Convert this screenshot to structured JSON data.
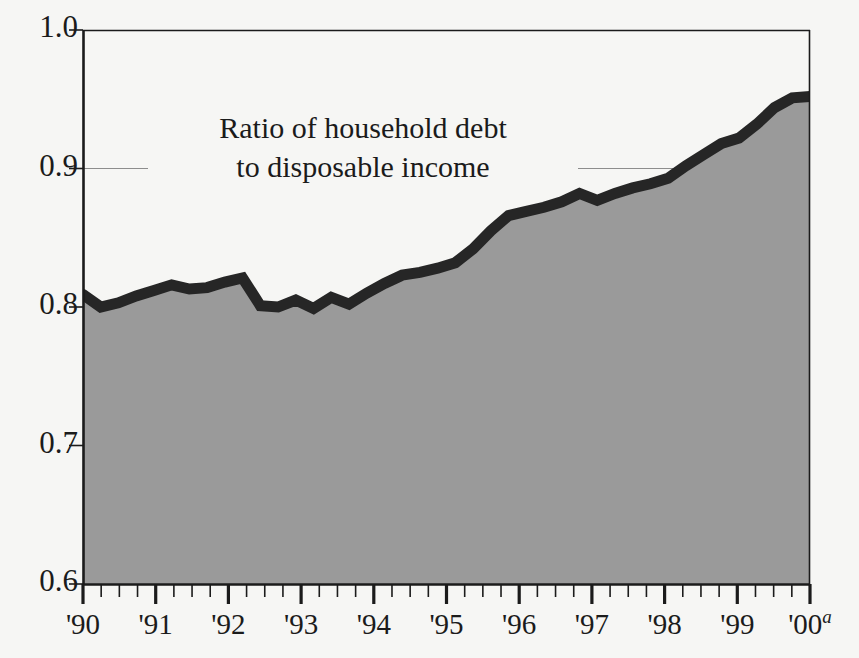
{
  "figure": {
    "background_color": "#f6f6f4",
    "plot_background_color": "#f6f6f4",
    "axis_color": "#1b1b1b",
    "gridline_color": "#8d8d8d"
  },
  "annotation": {
    "line1": "Ratio of household debt",
    "line2": "to disposable income"
  },
  "chart_data": {
    "type": "area",
    "title": "",
    "subtitle": "",
    "xlabel": "",
    "ylabel": "",
    "series_label": "Ratio of household debt to disposable income",
    "line_color": "#262626",
    "fill_color": "#9a9a9a",
    "grid": true,
    "grid_axis": "y",
    "legend_position": "inline-annotation",
    "ylim": [
      0.6,
      1.0
    ],
    "yticks": [
      0.6,
      0.7,
      0.8,
      0.9,
      1.0
    ],
    "ytick_labels": [
      "0.6",
      "0.7",
      "0.8",
      "0.9",
      "1.0"
    ],
    "xlim": [
      "1990Q1",
      "2000Q2"
    ],
    "xtick_labels": [
      "'90",
      "'91",
      "'92",
      "'93",
      "'94",
      "'95",
      "'96",
      "'97",
      "'98",
      "'99",
      "'00"
    ],
    "xtick_superscripts": [
      "",
      "",
      "",
      "",
      "",
      "",
      "",
      "",
      "",
      "",
      "a"
    ],
    "x_minor_ticks_per_year": 4,
    "x": [
      "1990Q1",
      "1990Q2",
      "1990Q3",
      "1990Q4",
      "1991Q1",
      "1991Q2",
      "1991Q3",
      "1991Q4",
      "1992Q1",
      "1992Q2",
      "1992Q3",
      "1992Q4",
      "1993Q1",
      "1993Q2",
      "1993Q3",
      "1993Q4",
      "1994Q1",
      "1994Q2",
      "1994Q3",
      "1994Q4",
      "1995Q1",
      "1995Q2",
      "1995Q3",
      "1995Q4",
      "1996Q1",
      "1996Q2",
      "1996Q3",
      "1996Q4",
      "1997Q1",
      "1997Q2",
      "1997Q3",
      "1997Q4",
      "1998Q1",
      "1998Q2",
      "1998Q3",
      "1998Q4",
      "1999Q1",
      "1999Q2",
      "1999Q3",
      "1999Q4",
      "2000Q1",
      "2000Q2"
    ],
    "values": [
      0.809,
      0.8,
      0.803,
      0.808,
      0.812,
      0.816,
      0.813,
      0.814,
      0.818,
      0.821,
      0.801,
      0.8,
      0.805,
      0.799,
      0.807,
      0.802,
      0.81,
      0.817,
      0.823,
      0.825,
      0.828,
      0.832,
      0.842,
      0.855,
      0.866,
      0.869,
      0.872,
      0.876,
      0.882,
      0.877,
      0.882,
      0.886,
      0.889,
      0.893,
      0.902,
      0.91,
      0.918,
      0.922,
      0.932,
      0.944,
      0.951,
      0.952
    ],
    "footnote_marker": "a"
  }
}
